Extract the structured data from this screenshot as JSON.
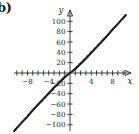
{
  "figure": {
    "panel_label": "b)",
    "background_color": "#ffffff",
    "ink_color": "#1a1a1a"
  },
  "chart_data": {
    "type": "line",
    "title": "",
    "subtitle": "",
    "xlabel": "x",
    "ylabel": "y",
    "xlim": [
      -11,
      11
    ],
    "ylim": [
      -115,
      115
    ],
    "grid": false,
    "legend": "none",
    "axes_style": "cartesian-arrows",
    "x_ticks": [
      -10,
      -9,
      -8,
      -7,
      -6,
      -5,
      -4,
      -3,
      -2,
      -1,
      1,
      2,
      3,
      4,
      5,
      6,
      7,
      8,
      9,
      10
    ],
    "x_tick_labels": [
      {
        "value": -8,
        "label": "−8"
      },
      {
        "value": -4,
        "label": "−4"
      },
      {
        "value": 4,
        "label": "4"
      },
      {
        "value": 8,
        "label": "8"
      }
    ],
    "y_ticks": [
      -100,
      -80,
      -60,
      -40,
      -20,
      20,
      40,
      60,
      80,
      100
    ],
    "y_tick_labels": [
      {
        "value": 100,
        "label": "100"
      },
      {
        "value": 80,
        "label": "80"
      },
      {
        "value": 60,
        "label": "60"
      },
      {
        "value": 40,
        "label": "40"
      },
      {
        "value": 20,
        "label": "20"
      },
      {
        "value": -20,
        "label": "−20"
      },
      {
        "value": -40,
        "label": "−40"
      },
      {
        "value": -60,
        "label": "−60"
      },
      {
        "value": -80,
        "label": "−80"
      },
      {
        "value": -100,
        "label": "−100"
      }
    ],
    "series": [
      {
        "name": "solid-curve",
        "style": "solid",
        "color": "#1a1a1a",
        "x": [
          -10.5,
          -9,
          -8,
          -7,
          -6,
          -5,
          -4,
          -3,
          -2,
          -1,
          0,
          1,
          2,
          3,
          4,
          5,
          6,
          7,
          8,
          9,
          10.5
        ],
        "values": [
          -112,
          -95,
          -84,
          -72,
          -61,
          -50,
          -39,
          -28,
          -18,
          -8,
          0,
          8,
          18,
          28,
          39,
          50,
          61,
          72,
          84,
          95,
          112
        ]
      },
      {
        "name": "dashed-line",
        "style": "dashed",
        "color": "#2b2b2b",
        "x": [
          -10.5,
          10.5
        ],
        "values": [
          -110,
          110
        ]
      }
    ]
  }
}
